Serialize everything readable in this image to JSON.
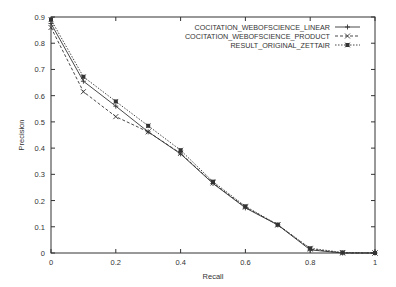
{
  "chart_data": {
    "type": "line",
    "title": "",
    "xlabel": "Recall",
    "ylabel": "Precision",
    "xlim": [
      0,
      1
    ],
    "ylim": [
      0,
      0.9
    ],
    "grid": false,
    "legend_position": "top-right",
    "x_ticks": [
      "0",
      "0.2",
      "0.4",
      "0.6",
      "0.8",
      "1"
    ],
    "y_ticks": [
      "0",
      "0.1",
      "0.2",
      "0.3",
      "0.4",
      "0.5",
      "0.6",
      "0.7",
      "0.8",
      "0.9"
    ],
    "x": [
      0,
      0.1,
      0.2,
      0.3,
      0.4,
      0.5,
      0.6,
      0.7,
      0.8,
      0.9,
      1.0
    ],
    "series": [
      {
        "name": "COCITATION_WEBOFSCIENCE_LINEAR",
        "marker": "+",
        "line": "solid",
        "values": [
          0.875,
          0.655,
          0.56,
          0.462,
          0.378,
          0.265,
          0.172,
          0.107,
          0.012,
          0.0,
          0.0
        ]
      },
      {
        "name": "COCITATION_WEBOFSCIENCE_PRODUCT",
        "marker": "x",
        "line": "dashed",
        "values": [
          0.86,
          0.615,
          0.52,
          0.462,
          0.38,
          0.267,
          0.175,
          0.107,
          0.015,
          0.0,
          0.0
        ]
      },
      {
        "name": "RESULT_ORIGINAL_ZETTAIR",
        "marker": "star",
        "line": "dotted",
        "values": [
          0.89,
          0.672,
          0.578,
          0.485,
          0.392,
          0.272,
          0.178,
          0.108,
          0.018,
          0.002,
          0.0
        ]
      }
    ]
  }
}
